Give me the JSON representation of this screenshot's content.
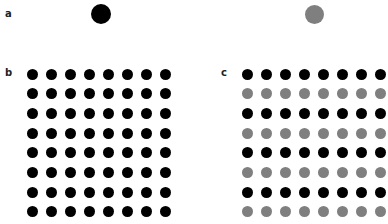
{
  "panels": {
    "a": {
      "label": "a",
      "stimuli": [
        {
          "name": "black-dot",
          "color": "#000000",
          "cx": 101,
          "cy": 14,
          "d": 20
        },
        {
          "name": "gray-dot",
          "color": "#7f7f7f",
          "cx": 314,
          "cy": 14,
          "d": 19
        }
      ]
    },
    "b": {
      "label": "b",
      "rows": 8,
      "cols": 8,
      "origin": {
        "x": 32,
        "y": 74
      },
      "spacing": {
        "x": 19,
        "y": 19.7
      },
      "row_colors": [
        "#000000",
        "#000000",
        "#000000",
        "#000000",
        "#000000",
        "#000000",
        "#000000",
        "#000000"
      ]
    },
    "c": {
      "label": "c",
      "rows": 8,
      "cols": 8,
      "origin": {
        "x": 247,
        "y": 74
      },
      "spacing": {
        "x": 19,
        "y": 19.7
      },
      "row_colors": [
        "#000000",
        "#7f7f7f",
        "#000000",
        "#7f7f7f",
        "#000000",
        "#7f7f7f",
        "#000000",
        "#7f7f7f"
      ]
    }
  },
  "colors": {
    "black": "#000000",
    "gray": "#7f7f7f"
  }
}
